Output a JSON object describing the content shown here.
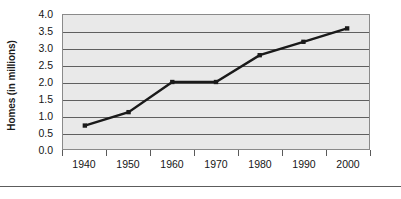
{
  "chart_data": {
    "type": "line",
    "title": "",
    "xlabel": "",
    "ylabel": "Homes (in millions)",
    "categories": [
      "1940",
      "1950",
      "1960",
      "1970",
      "1980",
      "1990",
      "2000"
    ],
    "x": [
      1940,
      1950,
      1960,
      1970,
      1980,
      1990,
      2000
    ],
    "values": [
      0.7,
      1.1,
      2.0,
      2.0,
      2.8,
      3.2,
      3.6
    ],
    "series": [
      {
        "name": "Homes",
        "values": [
          0.7,
          1.1,
          2.0,
          2.0,
          2.8,
          3.2,
          3.6
        ]
      }
    ],
    "ylim": [
      0.0,
      4.0
    ],
    "ytick_values": [
      0.0,
      0.5,
      1.0,
      1.5,
      2.0,
      2.5,
      3.0,
      3.5,
      4.0
    ],
    "ytick_labels": [
      "0.0",
      "0.5",
      "1.0",
      "1.5",
      "2.0",
      "2.5",
      "3.0",
      "3.5",
      "4.0"
    ],
    "grid": "horizontal",
    "legend": "none",
    "line_color": "#1a1a1a",
    "marker": "square",
    "plot_background": "#e9e9e9",
    "gridline_color": "#5f5f5f"
  },
  "axes": {
    "y_title": "Homes (in millions)",
    "y_ticks": [
      "4.0",
      "3.5",
      "3.0",
      "2.5",
      "2.0",
      "1.5",
      "1.0",
      "0.5",
      "0.0"
    ],
    "x_ticks": [
      "1940",
      "1950",
      "1960",
      "1970",
      "1980",
      "1990",
      "2000"
    ]
  }
}
